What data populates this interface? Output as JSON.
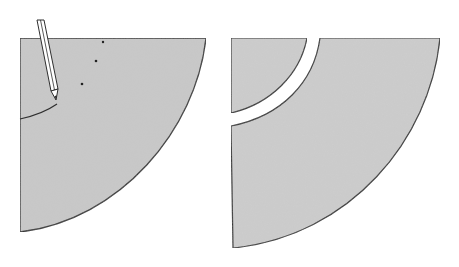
{
  "diagram": {
    "type": "illustration",
    "panels": [
      {
        "id": "left",
        "description": "Quarter-circle paper sector with a pencil marking an inner arc near the corner",
        "fill": "#c8c8c8",
        "stroke": "#333333"
      },
      {
        "id": "right",
        "description": "Same quarter-circle sector cut along the inner arc into a small corner piece and a larger curved piece, separated by a gap",
        "fill": "#cdcdcd",
        "stroke": "#333333"
      }
    ],
    "colors": {
      "background": "#ffffff",
      "paper": "#c9c9c9",
      "outline": "#333333",
      "pencil_body": "#ffffff"
    }
  }
}
